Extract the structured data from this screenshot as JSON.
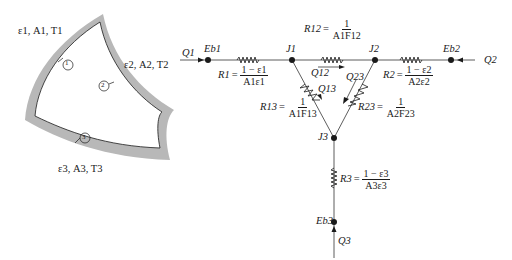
{
  "enclosure": {
    "surface_1": {
      "label": "ε1, A1, T1",
      "number": "1"
    },
    "surface_2": {
      "label": "ε2, A2, T2",
      "number": "2"
    },
    "surface_3": {
      "label": "ε3, A3, T3",
      "number": "3"
    },
    "wall_color": "#b8b8b8"
  },
  "network": {
    "nodes": {
      "Eb1": "Eb1",
      "Eb2": "Eb2",
      "Eb3": "Eb3",
      "J1": "J1",
      "J2": "J2",
      "J3": "J3"
    },
    "heat_flows": {
      "Q1": "Q1",
      "Q2": "Q2",
      "Q3": "Q3",
      "Q12": "Q12",
      "Q13": "Q13",
      "Q23": "Q23"
    },
    "resistances": {
      "R1": {
        "name": "R1",
        "num": "1 − ε1",
        "den": "A1ε1"
      },
      "R2": {
        "name": "R2",
        "num": "1 − ε2",
        "den": "A2ε2"
      },
      "R3": {
        "name": "R3",
        "num": "1 − ε3",
        "den": "A3ε3"
      },
      "R12": {
        "name": "R12",
        "num": "1",
        "den": "A1F12"
      },
      "R13": {
        "name": "R13",
        "num": "1",
        "den": "A1F13"
      },
      "R23": {
        "name": "R23",
        "num": "1",
        "den": "A2F23"
      }
    }
  }
}
